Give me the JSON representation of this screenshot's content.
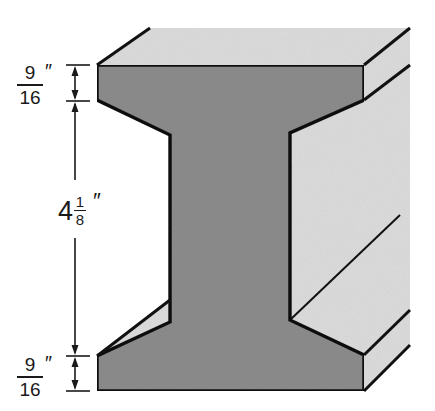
{
  "diagram": {
    "colors": {
      "cross_section_fill": "#8c8c8c",
      "side_face_fill": "#dcdcdc",
      "outline": "#111111",
      "background": "#ffffff"
    },
    "dimensions": {
      "top_flange": {
        "numerator": "9",
        "denominator": "16",
        "unit": "″"
      },
      "web_height": {
        "whole": "4",
        "numerator": "1",
        "denominator": "8",
        "unit": "″"
      },
      "bottom_flange": {
        "numerator": "9",
        "denominator": "16",
        "unit": "″"
      }
    }
  }
}
